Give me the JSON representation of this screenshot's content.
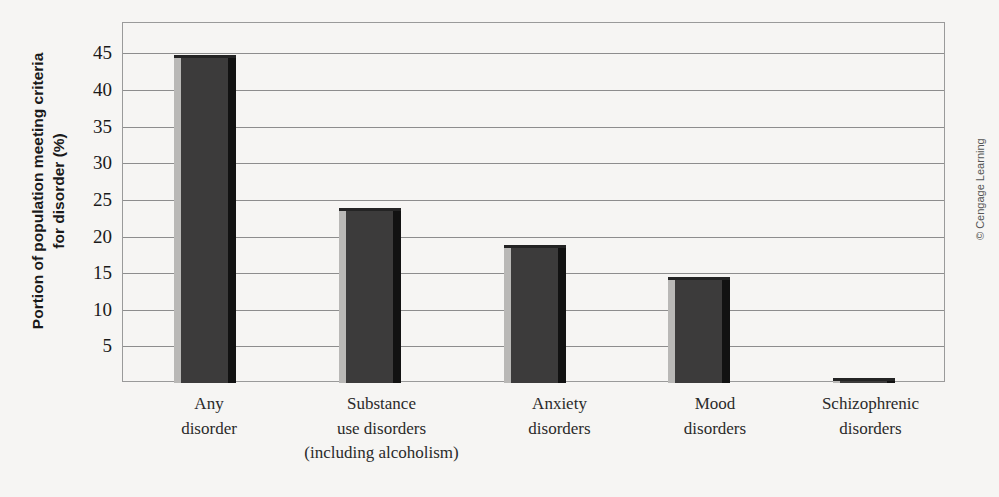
{
  "chart_data": {
    "type": "bar",
    "title": "",
    "xlabel": "",
    "ylabel": "Portion of population meeting criteria for disorder (%)",
    "ylabel_lines": [
      "Portion of population meeting criteria",
      "for disorder (%)"
    ],
    "categories": [
      "Any disorder",
      "Substance use disorders (including alcoholism)",
      "Anxiety disorders",
      "Mood disorders",
      "Schizophrenic disorders"
    ],
    "category_lines": [
      [
        "Any",
        "disorder"
      ],
      [
        "Substance",
        "use disorders",
        "(including alcoholism)"
      ],
      [
        "Anxiety",
        "disorders"
      ],
      [
        "Mood",
        "disorders"
      ],
      [
        "Schizophrenic",
        "disorders"
      ]
    ],
    "values": [
      44.3,
      23.7,
      18.7,
      14.3,
      0.7
    ],
    "ylim": [
      0,
      48
    ],
    "yticks": [
      5,
      10,
      15,
      20,
      25,
      30,
      35,
      40,
      45
    ],
    "ytick_labels": [
      "5",
      "10",
      "15",
      "20",
      "25",
      "30",
      "35",
      "40",
      "45"
    ],
    "grid": true,
    "grid_axis": "y",
    "legend": false,
    "bar_color": "#3c3b3b",
    "bar_highlight_color": "#b9b8b6",
    "bar_shadow_color": "#121212",
    "grid_color": "#8d8d8d",
    "frame_color": "#9a9a9a",
    "background_color": "#f6f5f3"
  },
  "credit": {
    "text": "© Cengage Learning"
  }
}
